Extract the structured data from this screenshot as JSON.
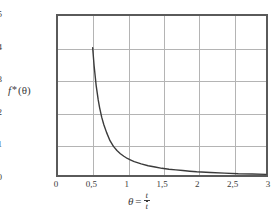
{
  "chart_data": {
    "type": "line",
    "title": "",
    "subtitle": "",
    "xlabel": "θ = t/t̄",
    "xlabel_parts": {
      "symbol": "θ",
      "equals": "=",
      "numerator": "t",
      "denominator": "t"
    },
    "ylabel": "f *(θ)",
    "ylabel_parts": {
      "f": "f",
      "star": "*",
      "arg": "(θ)"
    },
    "xlim": [
      0,
      3
    ],
    "ylim": [
      0,
      5
    ],
    "grid": true,
    "legend": null,
    "xticks": [
      0,
      0.5,
      1,
      1.5,
      2,
      2.5,
      3
    ],
    "xtick_labels": [
      "0",
      "0,5",
      "1",
      "1,5",
      "2",
      "2,5",
      "3"
    ],
    "yticks": [
      0,
      1,
      2,
      3,
      4,
      5
    ],
    "ytick_labels": [
      "0",
      "1",
      "2",
      "3",
      "4",
      "5"
    ],
    "series": [
      {
        "name": "f*(θ)",
        "color": "#3b3b3b",
        "x": [
          0.5,
          0.52,
          0.55,
          0.58,
          0.6,
          0.63,
          0.66,
          0.7,
          0.75,
          0.8,
          0.85,
          0.9,
          0.95,
          1.0,
          1.05,
          1.1,
          1.2,
          1.3,
          1.4,
          1.5,
          1.6,
          1.7,
          1.8,
          1.9,
          2.0,
          2.2,
          2.4,
          2.6,
          2.8,
          3.0
        ],
        "y": [
          4.0,
          3.45,
          2.82,
          2.36,
          2.12,
          1.82,
          1.59,
          1.34,
          1.08,
          0.9,
          0.77,
          0.67,
          0.59,
          0.52,
          0.47,
          0.42,
          0.35,
          0.29,
          0.25,
          0.21,
          0.18,
          0.16,
          0.14,
          0.12,
          0.1,
          0.08,
          0.06,
          0.04,
          0.03,
          0.02
        ]
      }
    ],
    "colors": {
      "curve": "#3b3b3b",
      "grid": "#b4b4b4",
      "axis": "#5a5a5a",
      "background": "#ffffff",
      "text": "#3b3b3b"
    }
  }
}
